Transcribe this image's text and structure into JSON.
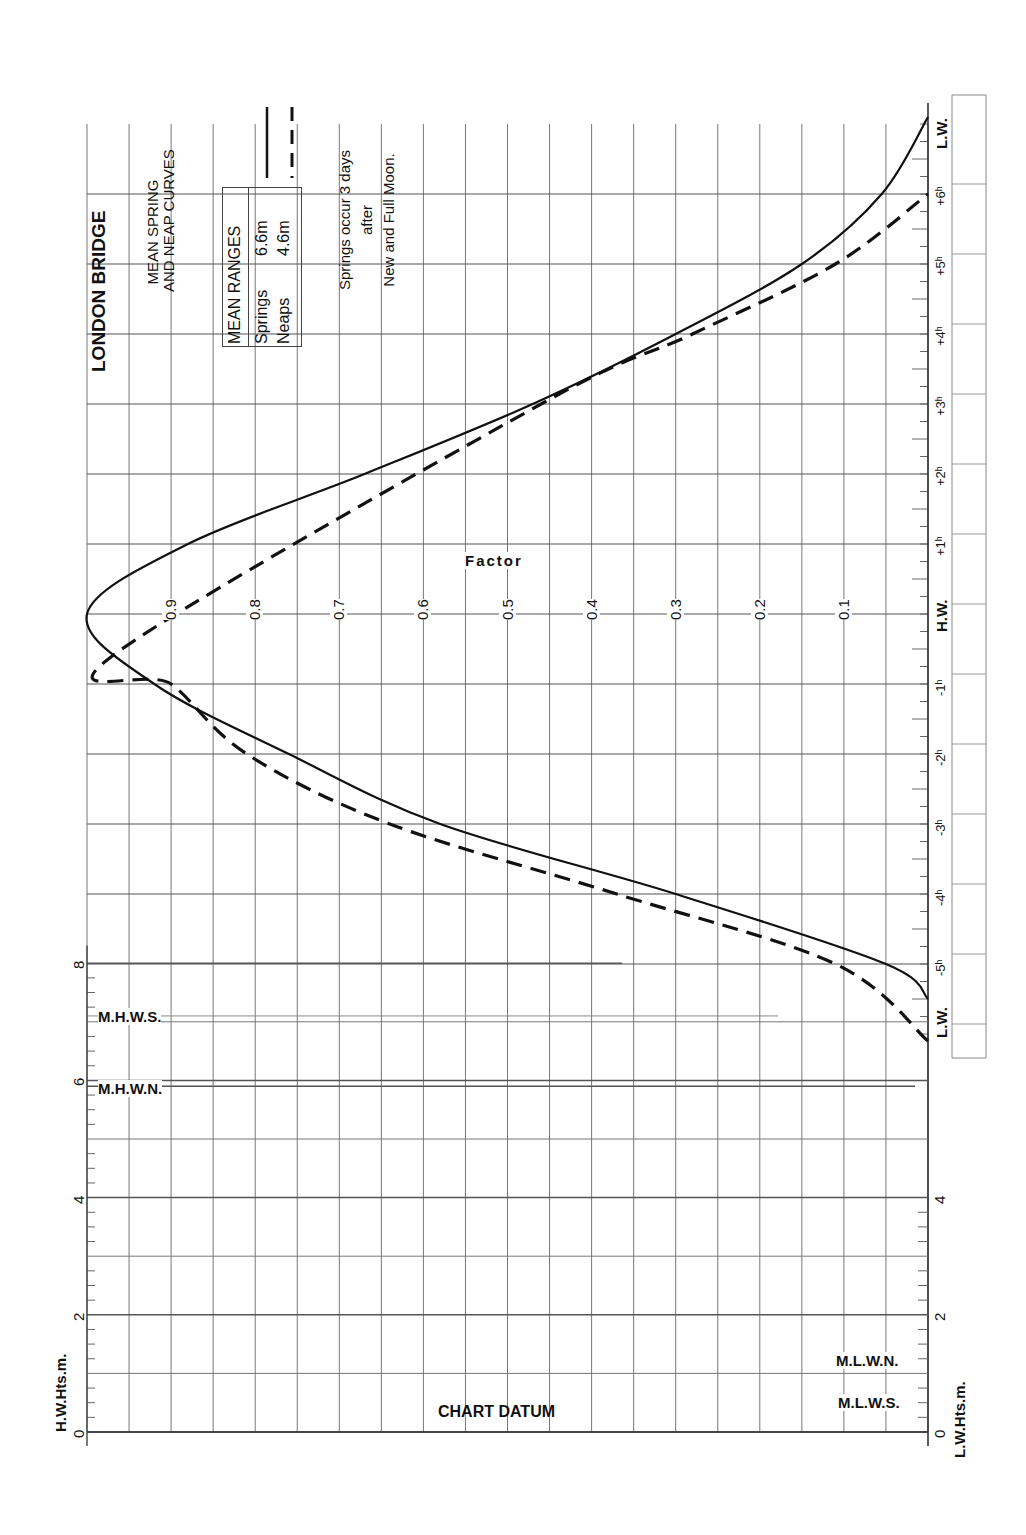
{
  "header": {
    "title": "LONDON BRIDGE",
    "subtitle_line1": "MEAN SPRING",
    "subtitle_line2": "AND NEAP CURVES"
  },
  "legend": {
    "box_title": "MEAN RANGES",
    "springs_label": "Springs",
    "springs_value": "6.6m",
    "neaps_label": "Neaps",
    "neaps_value": "4.6m",
    "note_line1": "Springs occur 3 days",
    "note_line2": "after",
    "note_line3": "New and Full Moon."
  },
  "axes": {
    "factor_title": "Factor",
    "factor_ticks": [
      "0.9",
      "0.8",
      "0.7",
      "0.6",
      "0.5",
      "0.4",
      "0.3",
      "0.2",
      "0.1"
    ],
    "time_labels": [
      "L.W.",
      "-5h",
      "-4h",
      "-3h",
      "-2h",
      "-1h",
      "H.W.",
      "+1h",
      "+2h",
      "+3h",
      "+4h",
      "+5h",
      "+6h",
      "L.W."
    ],
    "hw_height_label": "H.W.Hts.m.",
    "lw_height_label": "L.W.Hts.m.",
    "hw_height_ticks": [
      "0",
      "2",
      "4",
      "6",
      "8"
    ],
    "lw_height_ticks": [
      "0",
      "2",
      "4"
    ],
    "chart_datum": "CHART DATUM",
    "levels": {
      "mhws": "M.H.W.S.",
      "mhwn": "M.H.W.N.",
      "mlwn": "M.L.W.N.",
      "mlws": "M.L.W.S."
    }
  },
  "chart_data": {
    "type": "line",
    "orientation": "rotated 90° (time axis vertical, factor axis horizontal)",
    "xlabel": "Time relative to High Water (hours)",
    "ylabel": "Factor",
    "ylim": [
      0,
      1
    ],
    "grid": true,
    "series": [
      {
        "name": "Springs (mean range 6.6m)",
        "style": "solid",
        "x": [
          -5.5,
          -5,
          -4,
          -3,
          -2,
          -1,
          0,
          1,
          2,
          3,
          4,
          5,
          6,
          7.1
        ],
        "values": [
          0.0,
          0.05,
          0.3,
          0.58,
          0.76,
          0.92,
          1.0,
          0.88,
          0.67,
          0.47,
          0.3,
          0.15,
          0.055,
          0.0
        ]
      },
      {
        "name": "Neaps (mean range 4.6m)",
        "style": "dashed",
        "x": [
          -6.1,
          -5,
          -4,
          -3,
          -2,
          -1,
          -0.6,
          3,
          4,
          5,
          6
        ],
        "values": [
          0.0,
          0.11,
          0.37,
          0.64,
          0.81,
          0.9,
          0.97,
          0.46,
          0.28,
          0.11,
          0.0
        ]
      }
    ],
    "height_scale": {
      "hw_heights_m": {
        "min": 0,
        "max": 8,
        "ticks": [
          0,
          2,
          4,
          6,
          8
        ]
      },
      "lw_heights_m": {
        "min": 0,
        "max": 4,
        "ticks": [
          0,
          2,
          4
        ]
      },
      "levels_m": {
        "MHWS": 7.1,
        "MHWN": 5.9,
        "MLWN": 1.3,
        "MLWS": 0.5
      }
    }
  }
}
